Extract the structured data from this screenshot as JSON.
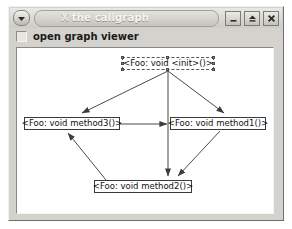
{
  "window": {
    "title": "the callgraph",
    "title_glyph": "X",
    "menu_icon": "caret-down-icon",
    "controls": [
      {
        "name": "minimize",
        "label": "_",
        "icon": "minimize-icon"
      },
      {
        "name": "maximize",
        "label": "^",
        "icon": "maximize-icon"
      },
      {
        "name": "close",
        "label": "X",
        "icon": "close-icon"
      }
    ]
  },
  "toolbar": {
    "checkbox_label": "open graph viewer",
    "checkbox_checked": false
  },
  "graph": {
    "nodes": [
      {
        "id": "init",
        "label": "<Foo: void <init>()>",
        "selected": true,
        "x": 104,
        "y": 8,
        "w": 92
      },
      {
        "id": "method3",
        "label": "<Foo: void method3()>",
        "selected": false,
        "x": 6,
        "y": 68,
        "w": 96
      },
      {
        "id": "method1",
        "label": "<Foo: void method1()>",
        "selected": false,
        "x": 152,
        "y": 68,
        "w": 96
      },
      {
        "id": "method2",
        "label": "<Foo: void method2()>",
        "selected": false,
        "x": 76,
        "y": 131,
        "w": 98
      }
    ],
    "edges": [
      {
        "from": "init",
        "to": "method3",
        "arrow": true
      },
      {
        "from": "init",
        "to": "method1",
        "arrow": true
      },
      {
        "from": "init",
        "to": "method2",
        "arrow": true
      },
      {
        "from": "method3",
        "to": "method1",
        "arrow": true
      },
      {
        "from": "method1",
        "to": "method2",
        "arrow": true
      },
      {
        "from": "method2",
        "to": "method3",
        "arrow": true
      }
    ],
    "edge_color": "#4a4a4a",
    "node_border_color": "#3a3a3a"
  }
}
